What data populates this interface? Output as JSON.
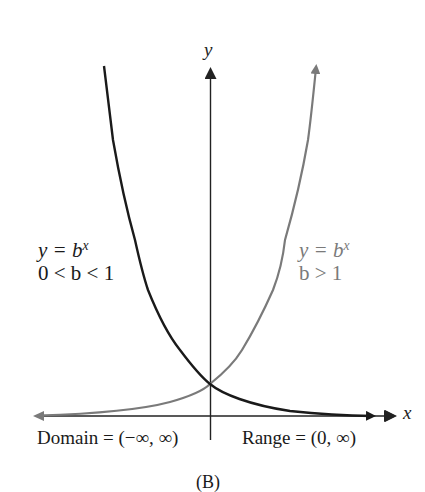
{
  "figure": {
    "caption": "(B)",
    "axes": {
      "x_label": "x",
      "y_label": "y"
    },
    "curves": [
      {
        "id": "decay",
        "equation_lhs": "y = b",
        "equation_exp": "x",
        "condition": "0 < b < 1",
        "color": "#1a1a1a"
      },
      {
        "id": "growth",
        "equation_lhs": "y = b",
        "equation_exp": "x",
        "condition": "b > 1",
        "color": "#7a7a7a"
      }
    ],
    "domain_text": "Domain = (−∞, ∞)",
    "range_text": "Range = (0, ∞)",
    "colors": {
      "axis": "#222222",
      "decay_curve": "#1a1a1a",
      "growth_curve": "#7a7a7a",
      "background": "#ffffff"
    }
  }
}
